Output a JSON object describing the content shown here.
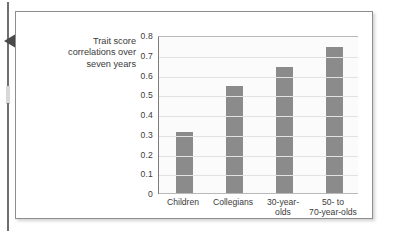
{
  "figure": {
    "caption": "Trait score correlations over seven years",
    "caption_lines": [
      "Trait score",
      "correlations over",
      "seven years"
    ],
    "pointer_icon": "left-triangle-pointer-icon"
  },
  "chart_data": {
    "type": "bar",
    "title": "",
    "subtitle": "",
    "xlabel": "",
    "ylabel": "Trait score correlations over seven years",
    "categories": [
      "Children",
      "Collegians",
      "30-year-olds",
      "50- to 70-year-olds"
    ],
    "category_lines": [
      [
        "Children"
      ],
      [
        "Collegians"
      ],
      [
        "30-year-",
        "olds"
      ],
      [
        "50- to",
        "70-year-olds"
      ]
    ],
    "values": [
      0.31,
      0.54,
      0.64,
      0.74
    ],
    "ylim": [
      0,
      0.8
    ],
    "ytick_labels": [
      "0.8",
      "0.7",
      "0.6",
      "0.5",
      "0.4",
      "0.3",
      "0.2",
      "0.1",
      "0"
    ],
    "ytick_values": [
      0.8,
      0.7,
      0.6,
      0.5,
      0.4,
      0.3,
      0.2,
      0.1,
      0
    ],
    "grid": true,
    "legend": false,
    "legend_position": "none",
    "bar_color": "#8b8b8b",
    "plot_background": "#fbfbfb",
    "gridline_color": "#e2e2e2",
    "text_color": "#3b3b3b"
  }
}
